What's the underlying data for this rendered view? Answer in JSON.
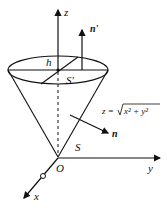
{
  "diagram": {
    "type": "cone surface with normals",
    "labels": {
      "z_axis": "z",
      "y_axis": "y",
      "x_axis": "x",
      "origin": "O",
      "normal_top": "n'",
      "normal_side": "n",
      "height": "h",
      "top_surface": "S'",
      "side_surface": "S",
      "equation_lhs": "z = ",
      "equation_rhs": "x² + y²"
    },
    "colors": {
      "stroke": "#111111",
      "background": "#ffffff"
    }
  }
}
